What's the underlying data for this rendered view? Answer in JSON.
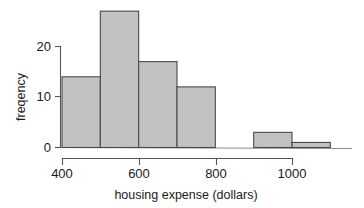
{
  "chart_data": {
    "type": "bar",
    "title": "",
    "subtitle": "",
    "xlabel": "housing expense (dollars)",
    "ylabel": "freqency",
    "bin_width": 100,
    "bin_edges": [
      400,
      500,
      600,
      700,
      800,
      900,
      1000,
      1100
    ],
    "categories": [
      "400-500",
      "500-600",
      "600-700",
      "700-800",
      "800-900",
      "900-1000",
      "1000-1100"
    ],
    "values": [
      14,
      27,
      17,
      12,
      0,
      3,
      1
    ],
    "xlim": [
      380,
      1120
    ],
    "ylim": [
      0,
      28
    ],
    "xticks": [
      400,
      600,
      800,
      1000
    ],
    "xtick_labels": [
      "400",
      "600",
      "800",
      "1000"
    ],
    "yticks": [
      0,
      10,
      20
    ],
    "ytick_labels": [
      "0",
      "10",
      "20"
    ],
    "grid": false,
    "legend": false,
    "legend_position": "none",
    "bar_fill_color": "#c2c2c2",
    "bar_edge_color": "#4a4a4a",
    "axis_color": "#555555",
    "background_color": "#ffffff",
    "annotations": []
  },
  "axes": {
    "y_title": "freqency",
    "x_title": "housing expense (dollars)"
  },
  "y_ticks": [
    {
      "label": "20",
      "value": 20
    },
    {
      "label": "10",
      "value": 10
    },
    {
      "label": "0",
      "value": 0
    }
  ],
  "x_ticks": [
    {
      "label": "400",
      "value": 400
    },
    {
      "label": "600",
      "value": 600
    },
    {
      "label": "800",
      "value": 800
    },
    {
      "label": "1000",
      "value": 1000
    }
  ]
}
